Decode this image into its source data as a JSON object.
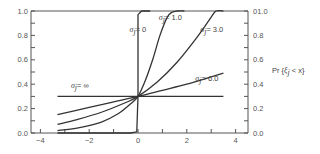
{
  "chart_data": {
    "type": "line",
    "title": "",
    "xlabel": "",
    "ylabel": "",
    "ylabel_right": "Pr {ξj < x}",
    "xlim": [
      -4.4,
      4.5
    ],
    "ylim": [
      0.0,
      1.0
    ],
    "x_ticks": [
      -4,
      -2,
      0,
      2,
      4
    ],
    "x_tick_labels": [
      "−4",
      "−2",
      "0",
      "2",
      "4"
    ],
    "y_ticks": [
      0.0,
      0.2,
      0.4,
      0.6,
      0.8,
      1.0
    ],
    "y_tick_labels_left": [
      "0.0",
      "0.2",
      "0.4",
      "0.6",
      "0.8",
      "1.0"
    ],
    "y_tick_labels_right": [
      "0.0",
      "0.2",
      "0.4",
      "0.6",
      "0.8",
      "01.0"
    ],
    "grid": false,
    "legend": "inline curve labels",
    "series": [
      {
        "name": "σj = 0",
        "label_text": "= 0",
        "points": [
          [
            -3.3,
            0.0
          ],
          [
            -0.3,
            0.0
          ],
          [
            -0.05,
            0.01
          ],
          [
            0.0,
            0.3
          ],
          [
            0.0,
            0.97
          ],
          [
            0.15,
            1.0
          ],
          [
            0.5,
            1.0
          ]
        ]
      },
      {
        "name": "σj = 1.0",
        "label_text": "= 1.0",
        "points": [
          [
            -3.3,
            0.02
          ],
          [
            -2.5,
            0.04
          ],
          [
            -1.5,
            0.09
          ],
          [
            -0.8,
            0.16
          ],
          [
            -0.3,
            0.24
          ],
          [
            0.0,
            0.3
          ],
          [
            0.3,
            0.43
          ],
          [
            0.6,
            0.6
          ],
          [
            0.9,
            0.8
          ],
          [
            1.2,
            0.95
          ],
          [
            1.4,
            0.99
          ],
          [
            1.6,
            1.0
          ],
          [
            1.9,
            1.0
          ]
        ]
      },
      {
        "name": "σj = 3.0",
        "label_text": "= 3.0",
        "points": [
          [
            -3.3,
            0.07
          ],
          [
            -2.5,
            0.11
          ],
          [
            -1.5,
            0.17
          ],
          [
            -0.5,
            0.25
          ],
          [
            0.0,
            0.3
          ],
          [
            0.8,
            0.42
          ],
          [
            1.6,
            0.58
          ],
          [
            2.4,
            0.78
          ],
          [
            3.0,
            0.95
          ],
          [
            3.2,
            1.0
          ],
          [
            3.5,
            1.0
          ]
        ]
      },
      {
        "name": "σj = 6.0",
        "label_text": "= 6.0",
        "points": [
          [
            -3.3,
            0.15
          ],
          [
            -2.0,
            0.21
          ],
          [
            -1.0,
            0.255
          ],
          [
            0.0,
            0.3
          ],
          [
            1.0,
            0.35
          ],
          [
            2.0,
            0.4
          ],
          [
            3.0,
            0.46
          ],
          [
            3.5,
            0.49
          ]
        ]
      },
      {
        "name": "σj = ∞",
        "label_text": "= ∞",
        "points": [
          [
            -3.3,
            0.3
          ],
          [
            3.5,
            0.3
          ]
        ]
      }
    ],
    "annotations": [
      {
        "text": "σj = 0",
        "x": -0.35,
        "y": 0.83
      },
      {
        "text": "σj = 1.0",
        "x": 0.85,
        "y": 0.93
      },
      {
        "text": "σj = 3.0",
        "x": 2.55,
        "y": 0.83
      },
      {
        "text": "σj = 6.0",
        "x": 2.35,
        "y": 0.43
      },
      {
        "text": "σj = ∞",
        "x": -2.75,
        "y": 0.37
      }
    ]
  },
  "labels": {
    "sigma": "σ",
    "sub_j": "j",
    "right_axis_title_prefix": "Pr {",
    "right_axis_title_xi": "ξ",
    "right_axis_title_sub": "j",
    "right_axis_title_suffix": " < x}"
  }
}
